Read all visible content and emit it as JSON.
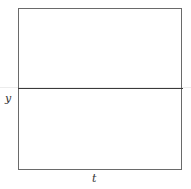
{
  "chart_data": {
    "type": "line",
    "title": "",
    "xlabel": "t",
    "ylabel": "y",
    "series": [
      {
        "name": "y = 0 (horizontal line)",
        "x": [
          0,
          1
        ],
        "values": [
          0,
          0
        ]
      }
    ],
    "grid": false,
    "legend": "none"
  },
  "axes": {
    "xlabel": "t",
    "ylabel": "y"
  }
}
